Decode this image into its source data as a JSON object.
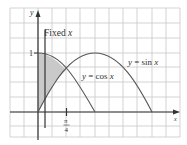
{
  "figure": {
    "axes": {
      "x_label": "x",
      "y_label": "y"
    },
    "y_tick_label": "1",
    "x_tick_label": {
      "numerator": "π",
      "denominator": "4"
    },
    "fixed_line_label_prefix": "Fixed ",
    "fixed_line_label_var": "x",
    "curves": [
      {
        "name": "sin",
        "label_prefix": "y = sin ",
        "label_var": "x"
      },
      {
        "name": "cos",
        "label_prefix": "y = cos ",
        "label_var": "x"
      }
    ],
    "colors": {
      "grid": "#c8c8c8",
      "axis": "#333333",
      "curve": "#555555",
      "shade": "#c9c9c9",
      "fixed_line": "#333333"
    }
  }
}
